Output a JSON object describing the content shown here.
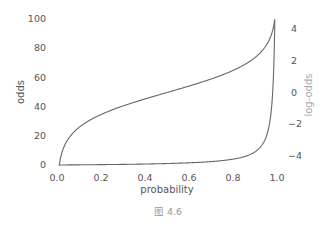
{
  "chart_data": {
    "type": "line",
    "title": "",
    "caption": "图 4.6",
    "xlabel": "probability",
    "ylabel": "odds",
    "y2label": "log-odds",
    "xlim": [
      0.0,
      1.0
    ],
    "ylim": [
      0,
      100
    ],
    "y2lim": [
      -4.6,
      4.6
    ],
    "grid": false,
    "legend": null,
    "x_ticks": [
      "0.0",
      "0.2",
      "0.4",
      "0.6",
      "0.8",
      "1.0"
    ],
    "y_ticks": [
      "0",
      "20",
      "40",
      "60",
      "80",
      "100"
    ],
    "y2_ticks": [
      "−4",
      "−2",
      "0",
      "2",
      "4"
    ],
    "x": [
      0.01,
      0.05,
      0.1,
      0.2,
      0.3,
      0.4,
      0.5,
      0.6,
      0.7,
      0.8,
      0.85,
      0.9,
      0.93,
      0.95,
      0.97,
      0.98,
      0.99
    ],
    "series": [
      {
        "name": "odds",
        "axis": "left",
        "formula": "p / (1 - p)",
        "values": [
          0.0101,
          0.0526,
          0.111,
          0.25,
          0.429,
          0.667,
          1.0,
          1.5,
          2.333,
          4.0,
          5.667,
          9.0,
          13.29,
          19.0,
          32.33,
          49.0,
          99.0
        ]
      },
      {
        "name": "log-odds",
        "axis": "right",
        "formula": "ln(p / (1 - p))",
        "values": [
          -4.595,
          -2.944,
          -2.197,
          -1.386,
          -0.847,
          -0.405,
          0.0,
          0.405,
          0.847,
          1.386,
          1.735,
          2.197,
          2.587,
          2.944,
          3.476,
          3.892,
          4.595
        ]
      }
    ]
  },
  "labels": {
    "xlabel": "probability",
    "ylabel": "odds",
    "y2label": "log-odds",
    "caption": "图 4.6",
    "x_ticks": [
      "0.0",
      "0.2",
      "0.4",
      "0.6",
      "0.8",
      "1.0"
    ],
    "y_ticks": [
      "0",
      "20",
      "40",
      "60",
      "80",
      "100"
    ],
    "y2_ticks": [
      "−4",
      "−2",
      "0",
      "2",
      "4"
    ]
  }
}
